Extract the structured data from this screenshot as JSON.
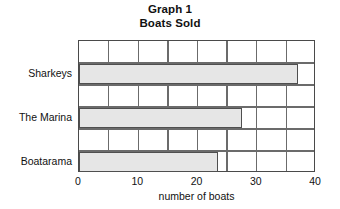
{
  "chart_data": {
    "type": "bar",
    "orientation": "horizontal",
    "title": "Graph 1",
    "subtitle": "Boats Sold",
    "title_lines": [
      "Graph 1",
      "Boats Sold"
    ],
    "categories": [
      "Sharkeys",
      "The Marina",
      "Boatarama"
    ],
    "values": [
      37,
      27.5,
      23.5
    ],
    "series": [
      {
        "name": "number of boats",
        "values": [
          37,
          27.5,
          23.5
        ]
      }
    ],
    "xlabel": "number of boats",
    "ylabel": "",
    "xlim": [
      0,
      40
    ],
    "xticks": [
      0,
      10,
      20,
      30,
      40
    ],
    "xtick_labels": [
      "0",
      "10",
      "20",
      "30",
      "40"
    ],
    "gridline_step": 5,
    "gridline_values": [
      5,
      10,
      15,
      20,
      25,
      30,
      35
    ],
    "grid": true,
    "legend": false,
    "bar_fill_color": "#e6e6e6",
    "bar_border_color": "#4f4f4f",
    "frame_color": "#4a4a4a",
    "grid_color": "#6b6b6b",
    "background_color": "#ffffff",
    "text_color": "#111111"
  }
}
